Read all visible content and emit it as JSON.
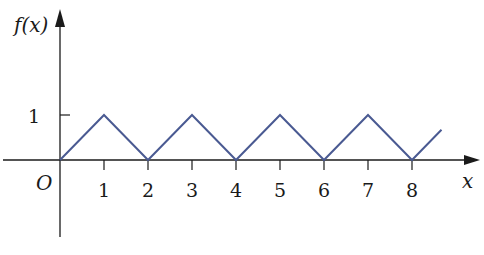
{
  "chart_data": {
    "type": "line",
    "title": "",
    "xlabel": "x",
    "ylabel": "f(x)",
    "origin_label": "O",
    "x": [
      0,
      1,
      2,
      3,
      4,
      5,
      6,
      7,
      8,
      8.67
    ],
    "values": [
      0,
      1,
      0,
      1,
      0,
      1,
      0,
      1,
      0,
      0.67
    ],
    "series": [
      {
        "name": "f(x)",
        "x": [
          0,
          1,
          2,
          3,
          4,
          5,
          6,
          7,
          8,
          8.67
        ],
        "values": [
          0,
          1,
          0,
          1,
          0,
          1,
          0,
          1,
          0,
          0.67
        ]
      }
    ],
    "x_ticks": [
      "1",
      "2",
      "3",
      "4",
      "5",
      "6",
      "7",
      "8"
    ],
    "y_ticks": [
      "1"
    ],
    "xlim": [
      -1.36,
      9.5
    ],
    "ylim": [
      -1.7,
      3.4
    ],
    "grid": false,
    "legend": "none",
    "line_color": "#4a5a92",
    "axis_color": "#1a1a1a"
  }
}
